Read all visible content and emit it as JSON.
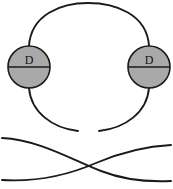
{
  "figure": {
    "width": 173,
    "height": 189,
    "background_color": "#ffffff",
    "stroke_color": "#1a1a1a",
    "node_fill_color": "#a9a9a9"
  },
  "nodes": [
    {
      "id": "left-node",
      "label": "D",
      "cx": 29,
      "cy": 67,
      "r": 21,
      "fill": "#a9a9a9",
      "stroke": "#1a1a1a"
    },
    {
      "id": "right-node",
      "label": "D",
      "cx": 149,
      "cy": 67,
      "r": 21,
      "fill": "#a9a9a9",
      "stroke": "#1a1a1a"
    }
  ],
  "paths": {
    "loop_top_left": "M 29 46 C 31 14, 62 3, 88 3",
    "loop_top_right": "M 88 3 C 115 3, 147 14, 149 46",
    "loop_bottom_left": "M 29 88 C 31 112, 52 128, 78 131",
    "loop_bottom_right": "M 149 88 C 147 112, 126 128, 99 131",
    "cross_curve_down": "M 2 138 C 40 140, 72 160, 101 171 C 124 180, 150 182, 171 181",
    "cross_curve_up": "M 2 180 C 34 182, 66 176, 96 163 C 122 152, 150 146, 171 145"
  },
  "labels": {
    "left_node_text": "D",
    "right_node_text": "D"
  }
}
